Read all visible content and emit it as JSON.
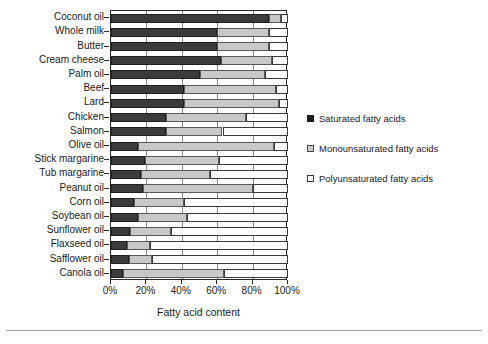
{
  "chart_data": {
    "type": "bar",
    "orientation": "horizontal",
    "stacked": true,
    "title": "",
    "xlabel": "Fatty acid content",
    "ylabel": "",
    "xlim": [
      0,
      100
    ],
    "xticks": [
      "0%",
      "20%",
      "40%",
      "60%",
      "80%",
      "100%"
    ],
    "xtick_values": [
      0,
      20,
      40,
      60,
      80,
      100
    ],
    "grid": true,
    "grid_axis": "x",
    "legend_position": "right",
    "categories": [
      "Coconut oil",
      "Whole milk",
      "Butter",
      "Cream cheese",
      "Palm oil",
      "Beef",
      "Lard",
      "Chicken",
      "Salmon",
      "Olive oil",
      "Stick margarine",
      "Tub margarine",
      "Peanut oil",
      "Corn oil",
      "Soybean oil",
      "Sunflower oil",
      "Flaxseed oil",
      "Safflower oil",
      "Canola oil"
    ],
    "series": [
      {
        "name": "Saturated fatty acids",
        "color": "#3b3b3b",
        "values": [
          89,
          60,
          60,
          62,
          50,
          41,
          41,
          31,
          31,
          15,
          19,
          17,
          18,
          13,
          15,
          11,
          9,
          10,
          7
        ]
      },
      {
        "name": "Monounsaturated fatty acids",
        "color": "#c8c8c8",
        "values": [
          7,
          29,
          29,
          29,
          37,
          52,
          54,
          45,
          32,
          77,
          42,
          39,
          62,
          28,
          28,
          23,
          13,
          13,
          57
        ]
      },
      {
        "name": "Polyunsaturated fatty acids",
        "color": "#ffffff",
        "values": [
          4,
          11,
          11,
          9,
          13,
          7,
          5,
          24,
          37,
          8,
          39,
          44,
          20,
          59,
          57,
          66,
          78,
          77,
          36
        ]
      }
    ]
  },
  "legend": {
    "items": [
      {
        "label": "Saturated fatty acids",
        "swatch": "saturated-swatch"
      },
      {
        "label": "Monounsaturated fatty acids",
        "swatch": "monounsaturated-swatch"
      },
      {
        "label": "Polyunsaturated fatty acids",
        "swatch": "polyunsaturated-swatch"
      }
    ]
  },
  "axis": {
    "x_title": "Fatty acid content"
  }
}
